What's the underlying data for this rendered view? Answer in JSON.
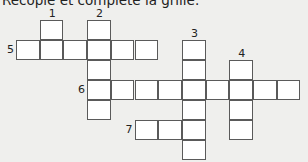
{
  "instruction": "Recopie et complète la grille.",
  "grid": {
    "origin_x": 16,
    "origin_y": 19.5,
    "cell_w": 23.7,
    "cell_h": 20,
    "words": [
      {
        "number": "1",
        "direction": "down",
        "col": 1,
        "row": 0,
        "length": 2
      },
      {
        "number": "2",
        "direction": "down",
        "col": 3,
        "row": 0,
        "length": 5
      },
      {
        "number": "3",
        "direction": "down",
        "col": 7,
        "row": 1,
        "length": 6
      },
      {
        "number": "4",
        "direction": "down",
        "col": 9,
        "row": 2,
        "length": 4
      },
      {
        "number": "5",
        "direction": "across",
        "col": 0,
        "row": 1,
        "length": 6
      },
      {
        "number": "6",
        "direction": "across",
        "col": 3,
        "row": 3,
        "length": 9
      },
      {
        "number": "7",
        "direction": "across",
        "col": 5,
        "row": 5,
        "length": 3
      }
    ]
  }
}
